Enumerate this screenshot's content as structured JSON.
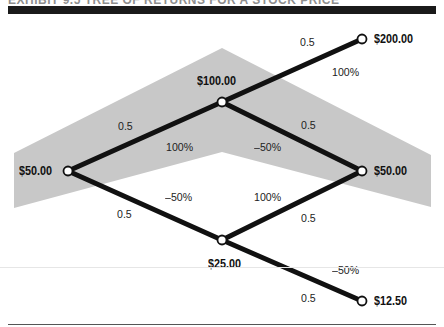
{
  "header": {
    "title": "EXHIBIT 9.5  TREE OF RETURNS FOR A STOCK PRICE"
  },
  "colors": {
    "band": "#c8c8c8",
    "edge": "#111111",
    "node_fill": "#ffffff"
  },
  "nodes": [
    {
      "id": "start",
      "label": "$50.00"
    },
    {
      "id": "up",
      "label": "$100.00"
    },
    {
      "id": "down",
      "label": "$25.00"
    },
    {
      "id": "upup",
      "label": "$200.00"
    },
    {
      "id": "updown",
      "label": "$50.00"
    },
    {
      "id": "downdown",
      "label": "$12.50"
    }
  ],
  "edges": [
    {
      "from": "start",
      "to": "up",
      "probability": "0.5",
      "return": "100%"
    },
    {
      "from": "start",
      "to": "down",
      "probability": "0.5",
      "return": "–50%"
    },
    {
      "from": "up",
      "to": "upup",
      "probability": "0.5",
      "return": "100%"
    },
    {
      "from": "up",
      "to": "updown",
      "probability": "0.5",
      "return": "–50%"
    },
    {
      "from": "down",
      "to": "updown",
      "probability": "0.5",
      "return": "100%"
    },
    {
      "from": "down",
      "to": "downdown",
      "probability": "0.5",
      "return": "–50%"
    }
  ]
}
